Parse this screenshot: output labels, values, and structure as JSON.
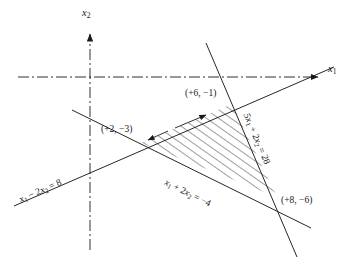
{
  "figure": {
    "type": "linear-programming-feasible-region",
    "background": "#ffffff",
    "ink": "#1a1a1a",
    "axes": {
      "x_label_base": "x",
      "x_label_sub": "1",
      "y_label_base": "x",
      "y_label_sub": "2",
      "style": "dash-dot",
      "origin_px": [
        90,
        77
      ]
    },
    "vertices": [
      {
        "name": "upper",
        "text": "(+6, −1)",
        "x": 6,
        "y": -1,
        "px": [
          232,
          104
        ]
      },
      {
        "name": "left",
        "text": "(+2, −3)",
        "x": 2,
        "y": -3,
        "px": [
          141,
          143
        ]
      },
      {
        "name": "lower-right",
        "text": "(+8, −6)",
        "x": 8,
        "y": -6,
        "px": [
          277,
          197
        ]
      }
    ],
    "constraint_lines": [
      {
        "name": "x1-minus-2x2-equals-8",
        "label_parts": {
          "a": "x",
          "a_sub": "1",
          "op": " − 2",
          "b": "x",
          "b_sub": "2",
          "eq": " = 8"
        },
        "label_text": "x1 − 2x2 = 8"
      },
      {
        "name": "x1-plus-2x2-equals-minus-4",
        "label_parts": {
          "a": "x",
          "a_sub": "1",
          "op": " + 2",
          "b": "x",
          "b_sub": "2",
          "eq": " = −4"
        },
        "label_text": "x1 + 2x2 = −4"
      },
      {
        "name": "5x1-plus-2x2-equals-28",
        "label_parts": {
          "a": "5x",
          "a_sub": "1",
          "op": " + 2",
          "b": "x",
          "b_sub": "2",
          "eq": " = 28"
        },
        "label_text": "5x1 + 2x2 = 28"
      }
    ],
    "feasible_region": {
      "name": "shaded-triangle",
      "fill": "hatched",
      "hatch_angle_deg": 55
    }
  }
}
